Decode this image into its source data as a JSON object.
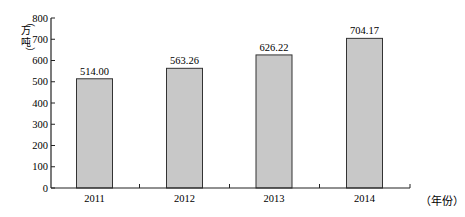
{
  "chart_data": {
    "type": "bar",
    "title": "",
    "xlabel": "（年份）",
    "ylabel": "（万吨）",
    "categories": [
      "2011",
      "2012",
      "2013",
      "2014"
    ],
    "values": [
      514.0,
      563.26,
      626.22,
      704.17
    ],
    "value_labels": [
      "514.00",
      "563.26",
      "626.22",
      "704.17"
    ],
    "ylim": [
      0,
      800
    ],
    "yticks": [
      0,
      100,
      200,
      300,
      400,
      500,
      600,
      700,
      800
    ],
    "grid": false,
    "legend": null,
    "bar_color": "#c8c8c8",
    "bar_edge_color": "#333333"
  }
}
